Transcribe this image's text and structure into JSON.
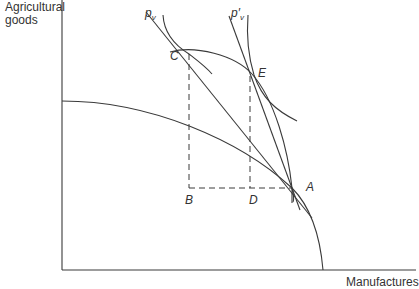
{
  "diagram": {
    "type": "economics-production-possibility",
    "axes": {
      "y_label": "Agricultural goods",
      "y_label_line1": "Agricultural",
      "y_label_line2": "goods",
      "x_label": "Manufactures"
    },
    "price_lines": {
      "pv": "p",
      "pv_sub": "v",
      "pv_prime": "p′",
      "pv_prime_sub": "v"
    },
    "points": {
      "A": "A",
      "B": "B",
      "C": "C",
      "D": "D",
      "E": "E"
    },
    "colors": {
      "line": "#3a3a3a",
      "background": "#ffffff"
    }
  }
}
